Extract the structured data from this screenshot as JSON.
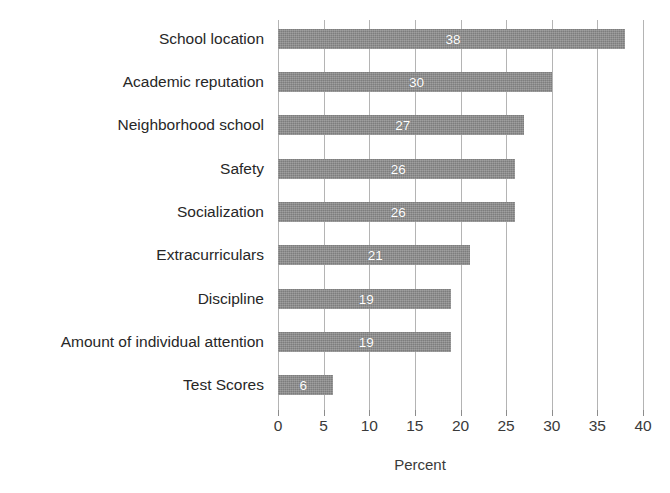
{
  "chart_data": {
    "type": "bar",
    "orientation": "horizontal",
    "title": "",
    "xlabel": "Percent",
    "ylabel": "",
    "xlim": [
      0,
      40
    ],
    "xticks": [
      0,
      5,
      10,
      15,
      20,
      25,
      30,
      35,
      40
    ],
    "xtick_labels": [
      "0",
      "5",
      "10",
      "15",
      "20",
      "25",
      "30",
      "35",
      "40"
    ],
    "grid": true,
    "legend": false,
    "bar_value_labels": true,
    "categories": [
      "School location",
      "Academic reputation",
      "Neighborhood school",
      "Safety",
      "Socialization",
      "Extracurriculars",
      "Discipline",
      "Amount of individual attention",
      "Test Scores"
    ],
    "values": [
      38,
      30,
      27,
      26,
      26,
      21,
      19,
      19,
      6
    ],
    "value_labels": [
      "38",
      "30",
      "27",
      "26",
      "26",
      "21",
      "19",
      "19",
      "6"
    ],
    "colors": {
      "bar_fill": "#8a8a8a",
      "bar_value_text": "#ffffff",
      "gridline": "#b4b4b4",
      "tick": "#8c8c8c",
      "category_text": "#272727",
      "axis_text": "#3a3a3a",
      "background": "#ffffff"
    }
  }
}
